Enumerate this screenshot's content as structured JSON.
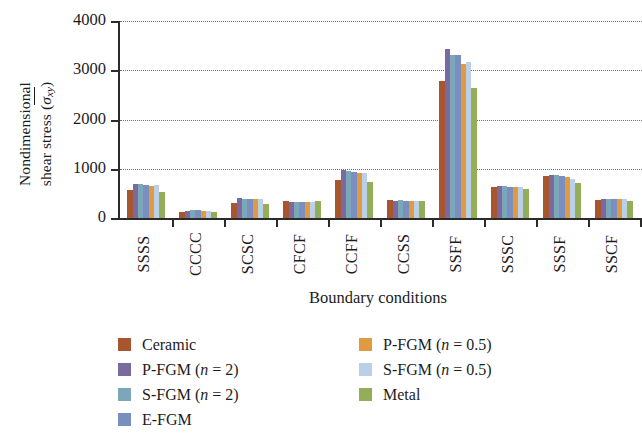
{
  "chart_data": {
    "type": "bar",
    "title": "",
    "xlabel": "Boundary conditions",
    "ylabel_line1": "Nondimensional",
    "ylabel_line2_prefix": "shear stress (",
    "ylabel_symbol": "σ",
    "ylabel_sub": "xy",
    "ylabel_line2_suffix": ")",
    "ylim": [
      0,
      4000
    ],
    "yticks": [
      0,
      1000,
      2000,
      3000,
      4000
    ],
    "ytick_labels": [
      "0",
      "1000",
      "2000",
      "3000",
      "4000"
    ],
    "grid": "horizontal-dotted",
    "legend_position": "bottom",
    "categories": [
      "SSSS",
      "CCCC",
      "SCSC",
      "CFCF",
      "CCFF",
      "CCSS",
      "SSFF",
      "SSSC",
      "SSSF",
      "SSCF"
    ],
    "series": [
      {
        "name": "Ceramic",
        "color": "#a8562e",
        "values": [
          560,
          130,
          300,
          355,
          780,
          370,
          2780,
          620,
          845,
          375
        ]
      },
      {
        "name": "P-FGM (n = 2)",
        "color": "#7a6a9d",
        "values": [
          700,
          150,
          400,
          325,
          975,
          350,
          3430,
          650,
          880,
          390
        ]
      },
      {
        "name": "S-FGM (n = 2)",
        "color": "#7ca7bb",
        "values": [
          690,
          155,
          385,
          330,
          950,
          360,
          3310,
          640,
          870,
          395
        ]
      },
      {
        "name": "E-FGM",
        "color": "#7a8ec0",
        "values": [
          680,
          155,
          380,
          330,
          940,
          355,
          3300,
          635,
          860,
          390
        ]
      },
      {
        "name": "P-FGM (n = 0.5)",
        "color": "#e09a42",
        "values": [
          660,
          150,
          385,
          325,
          905,
          350,
          3130,
          620,
          825,
          380
        ]
      },
      {
        "name": "S-FGM (n = 0.5)",
        "color": "#bbcfe7",
        "values": [
          665,
          150,
          390,
          330,
          915,
          355,
          3175,
          625,
          800,
          385
        ]
      },
      {
        "name": "Metal",
        "color": "#93ad59",
        "values": [
          530,
          125,
          285,
          340,
          735,
          345,
          2645,
          590,
          715,
          355
        ]
      }
    ]
  },
  "legend": {
    "items": [
      {
        "label": "Ceramic",
        "color": "#a8562e"
      },
      {
        "label": "P-FGM (n = 2)",
        "color": "#7a6a9d"
      },
      {
        "label": "S-FGM (n = 2)",
        "color": "#7ca7bb"
      },
      {
        "label": "E-FGM",
        "color": "#7a8ec0"
      },
      {
        "label": "P-FGM (n = 0.5)",
        "color": "#e09a42"
      },
      {
        "label": "S-FGM (n = 0.5)",
        "color": "#bbcfe7"
      },
      {
        "label": "Metal",
        "color": "#93ad59"
      }
    ]
  }
}
